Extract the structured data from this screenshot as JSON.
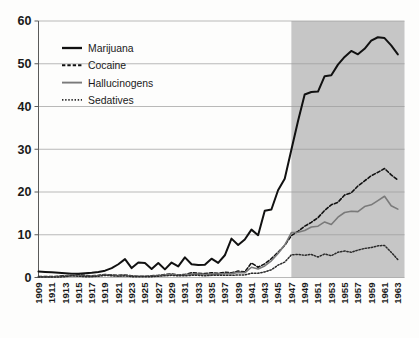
{
  "chart_data": {
    "type": "line",
    "title": "",
    "subtitle": "",
    "xlabel": "",
    "ylabel": "",
    "xlim": [
      1909,
      1964
    ],
    "ylim": [
      0,
      60
    ],
    "yticks": [
      0,
      10,
      20,
      30,
      40,
      50,
      60
    ],
    "grid": "horizontal",
    "legend_position": "upper-left-inside",
    "shaded_region": {
      "start": 1947,
      "end": 1964,
      "color": "#c6c6c6",
      "label": ""
    },
    "x": [
      1909,
      1910,
      1911,
      1912,
      1913,
      1914,
      1915,
      1916,
      1917,
      1918,
      1919,
      1920,
      1921,
      1922,
      1923,
      1924,
      1925,
      1926,
      1927,
      1928,
      1929,
      1930,
      1931,
      1932,
      1933,
      1934,
      1935,
      1936,
      1937,
      1938,
      1939,
      1940,
      1941,
      1942,
      1943,
      1944,
      1945,
      1946,
      1947,
      1948,
      1949,
      1950,
      1951,
      1952,
      1953,
      1954,
      1955,
      1956,
      1957,
      1958,
      1959,
      1960,
      1961,
      1962,
      1963
    ],
    "xticks": [
      1909,
      1911,
      1913,
      1915,
      1917,
      1919,
      1921,
      1923,
      1925,
      1927,
      1929,
      1931,
      1933,
      1935,
      1937,
      1939,
      1941,
      1943,
      1945,
      1947,
      1949,
      1951,
      1953,
      1955,
      1957,
      1959,
      1961,
      1963
    ],
    "xticklabels": [
      "1909",
      "1911",
      "1913",
      "1915",
      "1917",
      "1919",
      "1921",
      "1923",
      "1925",
      "1927",
      "1929",
      "1931",
      "1933",
      "1935",
      "1937",
      "1939",
      "1941",
      "1943",
      "1945",
      "1947",
      "1949",
      "1951",
      "1953",
      "1955",
      "1957",
      "1959",
      "1961",
      "1963"
    ],
    "series": [
      {
        "name": "Marijuana",
        "color": "#111111",
        "style": "solid",
        "width": 2.0,
        "values": [
          1.4,
          1.3,
          1.2,
          1.1,
          1.0,
          0.9,
          0.9,
          1.0,
          1.1,
          1.3,
          1.6,
          2.2,
          3.1,
          4.3,
          2.2,
          3.5,
          3.4,
          2.0,
          3.4,
          1.9,
          3.5,
          2.6,
          4.7,
          3.1,
          2.9,
          3.0,
          4.4,
          3.4,
          5.2,
          9.1,
          7.6,
          8.9,
          11.2,
          9.9,
          15.6,
          15.9,
          20.4,
          23.1,
          29.9,
          36.6,
          42.8,
          43.4,
          43.5,
          47.1,
          47.3,
          49.8,
          51.6,
          53.0,
          52.2,
          53.5,
          55.4,
          56.2,
          56.0,
          54.3,
          52.2
        ]
      },
      {
        "name": "Cocaine",
        "color": "#111111",
        "style": "dashed",
        "width": 1.6,
        "values": [
          0.2,
          0.2,
          0.2,
          0.3,
          0.4,
          0.5,
          0.6,
          0.5,
          0.4,
          0.5,
          0.7,
          0.6,
          0.5,
          0.6,
          0.4,
          0.3,
          0.3,
          0.4,
          0.5,
          0.7,
          0.8,
          0.6,
          0.7,
          1.1,
          1.0,
          0.9,
          1.1,
          1.0,
          1.2,
          1.1,
          1.5,
          1.3,
          3.4,
          2.4,
          3.2,
          4.4,
          5.9,
          7.5,
          9.8,
          10.8,
          12.0,
          12.9,
          14.0,
          15.7,
          17.0,
          17.6,
          19.3,
          19.8,
          21.4,
          22.6,
          23.8,
          24.6,
          25.5,
          24.0,
          22.8
        ]
      },
      {
        "name": "Hallucinogens",
        "color": "#7a7a7a",
        "style": "solid",
        "width": 1.6,
        "values": [
          0.1,
          0.1,
          0.1,
          0.2,
          0.3,
          0.5,
          0.4,
          0.3,
          0.3,
          0.4,
          0.6,
          0.5,
          0.4,
          0.5,
          0.3,
          0.3,
          0.3,
          0.3,
          0.4,
          0.6,
          0.7,
          0.5,
          0.6,
          0.8,
          0.8,
          0.7,
          0.8,
          0.8,
          0.9,
          0.9,
          1.2,
          1.1,
          2.4,
          2.0,
          2.7,
          3.9,
          5.6,
          7.6,
          10.5,
          10.6,
          11.0,
          11.8,
          12.0,
          13.0,
          12.4,
          14.1,
          15.2,
          15.5,
          15.4,
          16.6,
          17.0,
          18.0,
          19.0,
          16.8,
          16.0
        ]
      },
      {
        "name": "Sedatives",
        "color": "#2a2a2a",
        "style": "dotted",
        "width": 1.5,
        "values": [
          0.1,
          0.1,
          0.1,
          0.1,
          0.2,
          0.4,
          0.3,
          0.2,
          0.2,
          0.3,
          0.5,
          0.4,
          0.3,
          0.4,
          0.2,
          0.2,
          0.2,
          0.2,
          0.3,
          0.4,
          0.5,
          0.4,
          0.4,
          0.5,
          0.5,
          0.4,
          0.5,
          0.5,
          0.5,
          0.5,
          0.6,
          0.6,
          1.0,
          1.0,
          1.3,
          1.8,
          2.9,
          3.6,
          5.3,
          5.4,
          5.2,
          5.4,
          4.8,
          5.5,
          5.1,
          5.9,
          6.2,
          5.9,
          6.4,
          6.8,
          7.0,
          7.4,
          7.5,
          5.9,
          4.2
        ]
      }
    ]
  },
  "legend": {
    "items": [
      {
        "label": "Marijuana"
      },
      {
        "label": "Cocaine"
      },
      {
        "label": "Hallucinogens"
      },
      {
        "label": "Sedatives"
      }
    ]
  }
}
